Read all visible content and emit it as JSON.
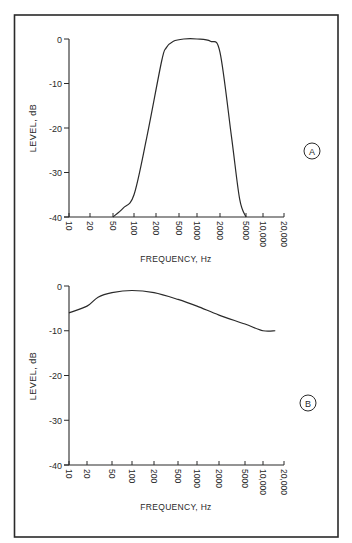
{
  "figure": {
    "frame_color": "#2a2a2a",
    "line_color": "#2a2a2a"
  },
  "chart_data": [
    {
      "panel": "A",
      "type": "line",
      "title": "",
      "xlabel": "FREQUENCY, Hz",
      "ylabel": "LEVEL, dB",
      "xscale": "log",
      "x_tick_labels": [
        "10",
        "20",
        "50",
        "100",
        "200",
        "500",
        "1000",
        "2000",
        "5000",
        "10,000",
        "20,000"
      ],
      "x_ticks": [
        10,
        20,
        50,
        100,
        200,
        500,
        1000,
        2000,
        5000,
        10000,
        20000
      ],
      "y_tick_labels": [
        "0",
        "-10",
        "-20",
        "-30",
        "-40"
      ],
      "y_ticks": [
        0,
        -10,
        -20,
        -30,
        -40
      ],
      "ylim": [
        -40,
        0
      ],
      "xlim": [
        10,
        20000
      ],
      "grid": false,
      "annotation": "A",
      "series": [
        {
          "name": "band-pass response",
          "x": [
            50,
            70,
            100,
            150,
            250,
            300,
            400,
            600,
            1000,
            1500,
            2000,
            3000,
            4000,
            5000
          ],
          "y": [
            -40,
            -38,
            -35,
            -22,
            -5,
            -2,
            -0.5,
            0,
            0,
            -0.5,
            -3,
            -22,
            -36,
            -40
          ]
        }
      ]
    },
    {
      "panel": "B",
      "type": "line",
      "title": "",
      "xlabel": "FREQUENCY, Hz",
      "ylabel": "LEVEL, dB",
      "xscale": "log",
      "x_tick_labels": [
        "10",
        "20",
        "50",
        "100",
        "200",
        "500",
        "1000",
        "2000",
        "5000",
        "10,000",
        "20,000"
      ],
      "x_ticks": [
        10,
        20,
        50,
        100,
        200,
        500,
        1000,
        2000,
        5000,
        10000,
        20000
      ],
      "y_tick_labels": [
        "0",
        "-10",
        "-20",
        "-30",
        "-40"
      ],
      "y_ticks": [
        0,
        -10,
        -20,
        -30,
        -40
      ],
      "ylim": [
        -40,
        0
      ],
      "xlim": [
        10,
        20000
      ],
      "grid": false,
      "annotation": "B",
      "series": [
        {
          "name": "broad response",
          "x": [
            10,
            20,
            30,
            50,
            100,
            200,
            500,
            1000,
            2000,
            5000,
            10000,
            15000
          ],
          "y": [
            -6,
            -4.5,
            -2.5,
            -1.5,
            -1,
            -1.5,
            -3,
            -4.5,
            -6.5,
            -8.5,
            -10,
            -10
          ]
        }
      ]
    }
  ]
}
